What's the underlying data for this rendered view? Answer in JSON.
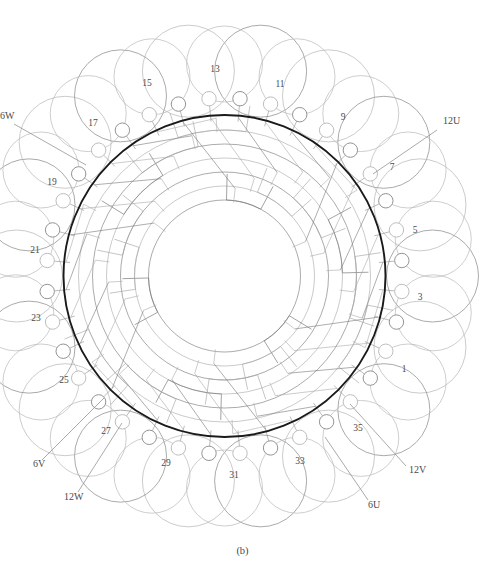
{
  "figure": {
    "caption": "(b)",
    "kind": "stator-winding-diagram"
  },
  "geometry": {
    "center_x": 224.5,
    "center_y": 276,
    "core_radius": 161,
    "terminal_ring_radius": 178,
    "terminal_dot_radius": 7.2,
    "slot_count": 36,
    "inner_band_radii": [
      76,
      90,
      104,
      118,
      132,
      146
    ],
    "start_angle_deg": -85
  },
  "colors": {
    "core_outline": "#1a1a1a",
    "wire": "#8d8d8d",
    "wire_light": "#b9b9b9",
    "band": "#777777",
    "band_light": "#a9a9a9",
    "text": "#4a4a4a",
    "background": "#ffffff"
  },
  "slot_labels": [
    {
      "id": "1",
      "text": "1",
      "x": 404,
      "y": 372
    },
    {
      "id": "3",
      "text": "3",
      "x": 420,
      "y": 300
    },
    {
      "id": "5",
      "text": "5",
      "x": 415,
      "y": 233
    },
    {
      "id": "7",
      "text": "7",
      "x": 392,
      "y": 170
    },
    {
      "id": "9",
      "text": "9",
      "x": 343,
      "y": 120
    },
    {
      "id": "11",
      "text": "11",
      "x": 280,
      "y": 87
    },
    {
      "id": "13",
      "text": "13",
      "x": 215,
      "y": 72
    },
    {
      "id": "15",
      "text": "15",
      "x": 147,
      "y": 86
    },
    {
      "id": "17",
      "text": "17",
      "x": 93,
      "y": 126
    },
    {
      "id": "19",
      "text": "19",
      "x": 52,
      "y": 185
    },
    {
      "id": "21",
      "text": "21",
      "x": 35,
      "y": 253
    },
    {
      "id": "23",
      "text": "23",
      "x": 36,
      "y": 321
    },
    {
      "id": "25",
      "text": "25",
      "x": 64,
      "y": 383
    },
    {
      "id": "27",
      "text": "27",
      "x": 106,
      "y": 434
    },
    {
      "id": "29",
      "text": "29",
      "x": 166,
      "y": 466
    },
    {
      "id": "31",
      "text": "31",
      "x": 234,
      "y": 478
    },
    {
      "id": "33",
      "text": "33",
      "x": 300,
      "y": 464
    },
    {
      "id": "35",
      "text": "35",
      "x": 358,
      "y": 431
    }
  ],
  "phase_leads": [
    {
      "id": "12U",
      "text": "12U",
      "label_x": 443,
      "label_y": 124,
      "line_x1": 437,
      "line_y1": 130,
      "line_x2": 373,
      "line_y2": 174
    },
    {
      "id": "12V",
      "text": "12V",
      "label_x": 409,
      "label_y": 473,
      "line_x1": 406,
      "line_y1": 466,
      "line_x2": 350,
      "line_y2": 404
    },
    {
      "id": "6U",
      "text": "6U",
      "label_x": 368,
      "label_y": 508,
      "line_x1": 368,
      "line_y1": 500,
      "line_x2": 325,
      "line_y2": 437
    },
    {
      "id": "12W",
      "text": "12W",
      "label_x": 64,
      "label_y": 500,
      "line_x1": 78,
      "line_y1": 492,
      "line_x2": 122,
      "line_y2": 423
    },
    {
      "id": "6V",
      "text": "6V",
      "label_x": 33,
      "label_y": 467,
      "line_x1": 42,
      "line_y1": 460,
      "line_x2": 104,
      "line_y2": 398
    },
    {
      "id": "6W",
      "text": "6W",
      "label_x": 0,
      "label_y": 119,
      "line_x1": 14,
      "line_y1": 124,
      "line_x2": 86,
      "line_y2": 165
    }
  ],
  "chart_data": {
    "type": "diagram",
    "title": "(b)",
    "slot_numbers": [
      1,
      3,
      5,
      7,
      9,
      11,
      13,
      15,
      17,
      19,
      21,
      23,
      25,
      27,
      29,
      31,
      33,
      35
    ],
    "phase_terminals": [
      "6U",
      "12U",
      "6V",
      "12V",
      "6W",
      "12W"
    ],
    "total_slots": 36
  }
}
